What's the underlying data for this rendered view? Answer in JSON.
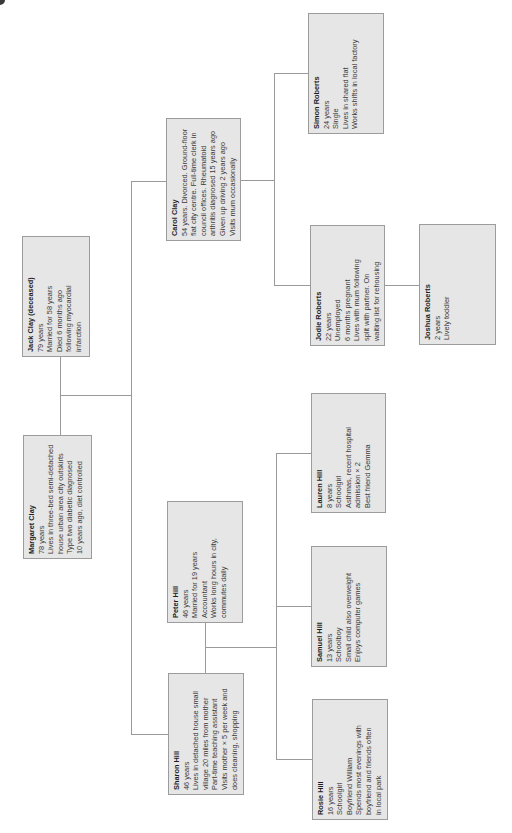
{
  "diagram": {
    "type": "family-genogram",
    "orientation": "rotated-90-ccw",
    "colors": {
      "box_fill": "#e6e6e6",
      "box_border": "#9c9c9c",
      "line": "#9a9a9a",
      "text": "#3a3a3a"
    },
    "people": {
      "jack": {
        "name": "Jack Clay (deceased)",
        "lines": [
          "79 years",
          "Married for 58 years",
          "Died 6 months ago",
          "following myocardial",
          "infarction"
        ]
      },
      "margaret": {
        "name": "Margaret Clay",
        "lines": [
          "78 years",
          "Lives in three-bed semi-detached",
          "house urban area city outskirts",
          "Type two diabetic diagnosed",
          "10 years ago, diet controlled"
        ]
      },
      "carol": {
        "name": "Carol Clay",
        "lines": [
          "54 years. Divorced. Ground-floor",
          "flat city centre. Full-time clerk in",
          "council offices. Rheumatoid",
          "arthritis diagnosed 15 years ago",
          "Given up driving 2 years ago",
          "Visits mum occasionally"
        ]
      },
      "simon": {
        "name": "Simon Roberts",
        "lines": [
          "24 years",
          "Single",
          "Lives in shared flat",
          "Works shifts in local factory"
        ]
      },
      "jodie": {
        "name": "Jodie Roberts",
        "lines": [
          "22 years",
          "Unemployed",
          "6 months pregnant",
          "Lives with mum following",
          "split with partner. On",
          "waiting list for rehousing"
        ]
      },
      "joshua": {
        "name": "Joshua Roberts",
        "lines": [
          "2 years",
          "Lively toddler"
        ]
      },
      "peter": {
        "name": "Peter Hill",
        "lines": [
          "46 years",
          "Married for 19 years",
          "Accountant",
          "Works long hours in city,",
          "commutes daily"
        ]
      },
      "sharon": {
        "name": "Sharon Hill",
        "lines": [
          "46 years",
          "Lives in detached house small",
          "village 20 miles from mother",
          "Part-time teaching assistant",
          "Visits mother × 5 per week and",
          "does cleaning, shopping"
        ]
      },
      "lauren": {
        "name": "Lauren Hill",
        "lines": [
          "8 years",
          "Schoolgirl",
          "Asthmas, recent hospital",
          "admission × 2",
          "Best friend Gemma"
        ]
      },
      "samuel": {
        "name": "Samuel Hill",
        "lines": [
          "13 years",
          "Schoolboy",
          "Small child also overweight",
          "Enjoys computer games"
        ]
      },
      "rosie": {
        "name": "Rosie Hill",
        "lines": [
          "16 years",
          "Schoolgirl",
          "Boyfriend William",
          "Spends most evenings with",
          "boyfriend and friends often",
          "in local park"
        ]
      }
    },
    "relationships": [
      {
        "type": "marriage",
        "members": [
          "Jack Clay",
          "Margaret Clay"
        ]
      },
      {
        "type": "children",
        "parents": [
          "Jack Clay",
          "Margaret Clay"
        ],
        "children": [
          "Carol Clay",
          "Sharon Hill"
        ]
      },
      {
        "type": "children",
        "parents": [
          "Carol Clay"
        ],
        "children": [
          "Simon Roberts",
          "Jodie Roberts"
        ]
      },
      {
        "type": "children",
        "parents": [
          "Jodie Roberts"
        ],
        "children": [
          "Joshua Roberts"
        ]
      },
      {
        "type": "marriage",
        "members": [
          "Peter Hill",
          "Sharon Hill"
        ]
      },
      {
        "type": "children",
        "parents": [
          "Peter Hill",
          "Sharon Hill"
        ],
        "children": [
          "Lauren Hill",
          "Samuel Hill",
          "Rosie Hill"
        ]
      }
    ]
  }
}
